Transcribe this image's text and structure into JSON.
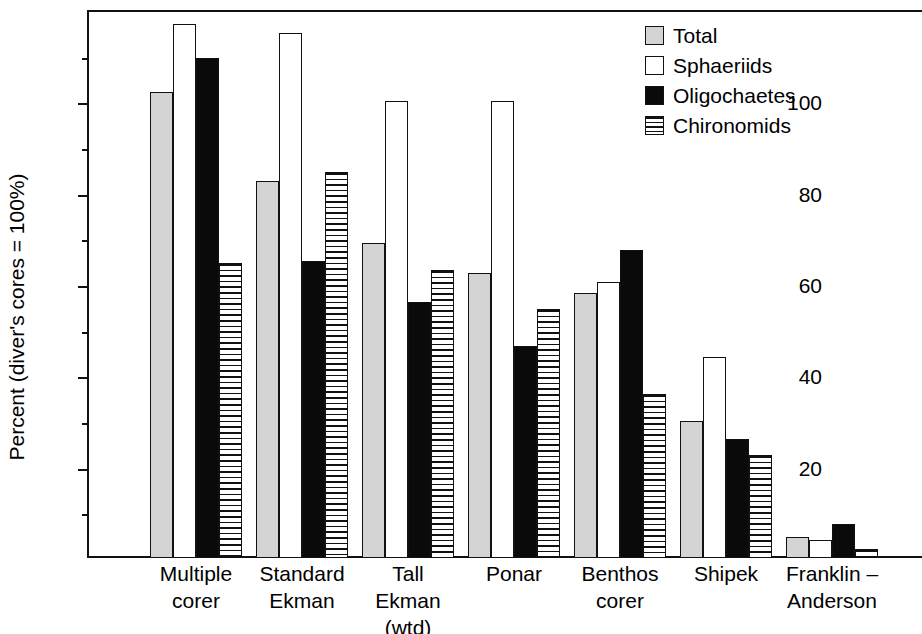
{
  "chart_data": {
    "type": "bar",
    "title": "",
    "xlabel": "",
    "ylabel": "Percent (diver's cores = 100%)",
    "ylim": [
      0,
      120
    ],
    "yticks_major": [
      20,
      40,
      60,
      80,
      100
    ],
    "yticks_minor": [
      10,
      30,
      50,
      70,
      90,
      110
    ],
    "ytick_labels": [
      "20",
      "40",
      "60",
      "80",
      "100"
    ],
    "grid": false,
    "legend_position": "top-right",
    "categories": [
      "Multiple\ncorer",
      "Standard\nEkman",
      "Tall\nEkman\n(wtd)",
      "Ponar",
      "Benthos\ncorer",
      "Shipek",
      "Franklin –\nAnderson"
    ],
    "series": [
      {
        "name": "Total",
        "color": "#d4d4d4",
        "pattern": "solid-gray",
        "values": [
          102,
          82.5,
          69,
          62.5,
          58,
          30,
          4.5
        ]
      },
      {
        "name": "Sphaeriids",
        "color": "#ffffff",
        "pattern": "open",
        "values": [
          117,
          115,
          100,
          100,
          60.5,
          44,
          4
        ]
      },
      {
        "name": "Oligochaetes",
        "color": "#0a0a0a",
        "pattern": "solid-black",
        "values": [
          109.5,
          65,
          56,
          46.5,
          67.5,
          26,
          7.5
        ]
      },
      {
        "name": "Chironomids",
        "color": "#ffffff",
        "pattern": "horizontal-hatch",
        "values": [
          64.5,
          84.5,
          63,
          54.5,
          36,
          22.5,
          2
        ]
      }
    ]
  },
  "legend": {
    "items": [
      {
        "label": "Total",
        "swatch": "total"
      },
      {
        "label": "Sphaeriids",
        "swatch": "sphaeriids"
      },
      {
        "label": "Oligochaetes",
        "swatch": "oligo"
      },
      {
        "label": "Chironomids",
        "swatch": "chiro"
      }
    ]
  }
}
